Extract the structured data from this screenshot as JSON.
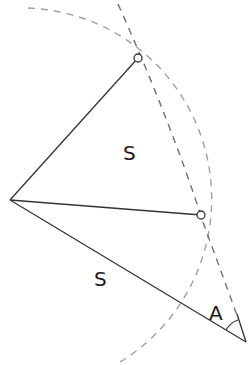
{
  "diagram": {
    "title": "",
    "labels": {
      "upper_side": "S",
      "lower_side": "S",
      "angle": "A"
    },
    "points": [
      "left-vertex",
      "top-point",
      "middle-point",
      "bottom-vertex"
    ],
    "colors": {
      "solid_line": "#333333",
      "construction_arc": "#a0a0a0",
      "construction_line": "#707070",
      "point_fill": "#ffffff"
    }
  }
}
